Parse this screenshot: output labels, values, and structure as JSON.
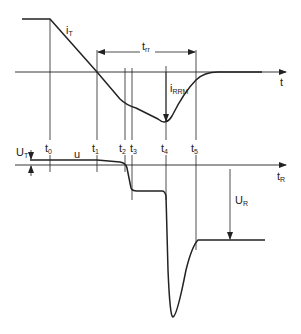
{
  "diagram": {
    "colors": {
      "stroke": "#222222",
      "background": "#ffffff"
    },
    "current_plot": {
      "curve_label": {
        "main": "i",
        "sub": "T"
      },
      "axis_label": "t",
      "trr_label": {
        "main": "t",
        "sub": "rr"
      },
      "irrm_label": {
        "main": "i",
        "sub": "RRM"
      }
    },
    "voltage_plot": {
      "curve_label": "u",
      "axis_label": {
        "main": "t",
        "sub": "R"
      },
      "ut_label": {
        "main": "U",
        "sub": "T"
      },
      "ur_label": {
        "main": "U",
        "sub": "R"
      }
    },
    "time_markers": [
      {
        "main": "t",
        "sub": "0"
      },
      {
        "main": "t",
        "sub": "1"
      },
      {
        "main": "t",
        "sub": "2"
      },
      {
        "main": "t",
        "sub": "3"
      },
      {
        "main": "t",
        "sub": "4"
      },
      {
        "main": "t",
        "sub": "5"
      }
    ]
  }
}
